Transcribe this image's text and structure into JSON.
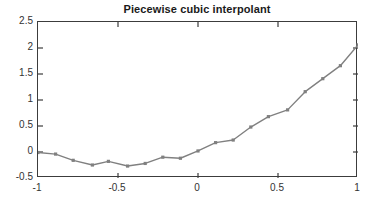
{
  "chart_data": {
    "type": "line",
    "title": "Piecewise cubic interpolant",
    "xlabel": "",
    "ylabel": "",
    "xlim": [
      -1,
      1
    ],
    "ylim": [
      -0.5,
      2.5
    ],
    "xticks": [
      -1,
      -0.5,
      0,
      0.5,
      1
    ],
    "xticklabels": [
      "-1",
      "-0.5",
      "0",
      "0.5",
      "1"
    ],
    "yticks": [
      -0.5,
      0,
      0.5,
      1,
      1.5,
      2,
      2.5
    ],
    "yticklabels": [
      "-0.5",
      "0",
      "0.5",
      "1",
      "1.5",
      "2",
      "2.5"
    ],
    "grid": false,
    "legend": null,
    "line_color": "#808080",
    "marker": "square",
    "marker_color": "#808080",
    "series": [
      {
        "name": "interpolant",
        "x": [
          -1.0,
          -0.89,
          -0.78,
          -0.66,
          -0.56,
          -0.44,
          -0.33,
          -0.22,
          -0.11,
          0.0,
          0.11,
          0.22,
          0.33,
          0.44,
          0.56,
          0.67,
          0.78,
          0.89,
          1.0
        ],
        "y": [
          -0.01,
          -0.04,
          -0.16,
          -0.25,
          -0.18,
          -0.27,
          -0.22,
          -0.1,
          -0.12,
          0.02,
          0.18,
          0.23,
          0.48,
          0.68,
          0.81,
          1.16,
          1.41,
          1.66,
          2.06
        ]
      }
    ]
  }
}
